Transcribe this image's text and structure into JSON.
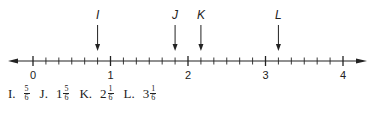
{
  "chart_data": {
    "type": "number-line",
    "range": [
      0,
      4
    ],
    "major_ticks": [
      0,
      1,
      2,
      3,
      4
    ],
    "major_tick_labels": [
      "0",
      "1",
      "2",
      "3",
      "4"
    ],
    "subdivisions_per_unit": 6,
    "arrows_both_ends": true,
    "points": [
      {
        "label": "I",
        "value": 0.8333,
        "answer_whole": "",
        "answer_num": "5",
        "answer_den": "6"
      },
      {
        "label": "J",
        "value": 1.8333,
        "answer_whole": "1",
        "answer_num": "5",
        "answer_den": "6"
      },
      {
        "label": "K",
        "value": 2.1667,
        "answer_whole": "2",
        "answer_num": "1",
        "answer_den": "6"
      },
      {
        "label": "L",
        "value": 3.1667,
        "answer_whole": "3",
        "answer_num": "1",
        "answer_den": "6"
      }
    ]
  },
  "answers": [
    {
      "letter": "I.",
      "whole": "",
      "num": "5",
      "den": "6"
    },
    {
      "letter": "J.",
      "whole": "1",
      "num": "5",
      "den": "6"
    },
    {
      "letter": "K.",
      "whole": "2",
      "num": "1",
      "den": "6"
    },
    {
      "letter": "L.",
      "whole": "3",
      "num": "1",
      "den": "6"
    }
  ],
  "colors": {
    "ink": "#222222",
    "background": "#ffffff"
  }
}
